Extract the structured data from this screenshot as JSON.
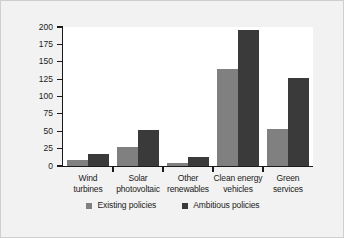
{
  "chart_data": {
    "type": "bar",
    "title": "",
    "subtitle": "",
    "xlabel": "",
    "ylabel": "US$ 2009 (billions)",
    "categories": [
      "Wind\nturbines",
      "Solar\nphotovoltaic",
      "Other\nrenewables",
      "Clean energy\nvehicles",
      "Green\nservices"
    ],
    "category_lines": [
      [
        "Wind",
        "turbines"
      ],
      [
        "Solar",
        "photovoltaic"
      ],
      [
        "Other",
        "renewables"
      ],
      [
        "Clean energy",
        "vehicles"
      ],
      [
        "Green",
        "services"
      ]
    ],
    "series": [
      {
        "name": "Existing policies",
        "color": "#808080",
        "values": [
          9,
          28,
          4,
          139,
          53
        ]
      },
      {
        "name": "Ambitious policies",
        "color": "#3a3a3a",
        "values": [
          17,
          52,
          13,
          195,
          127
        ]
      }
    ],
    "ylim": [
      0,
      200
    ],
    "ytick_values": [
      0,
      25,
      50,
      75,
      100,
      125,
      150,
      175,
      200
    ],
    "ytick_labels": [
      "0",
      "25",
      "50",
      "75",
      "100",
      "125",
      "150",
      "175",
      "200"
    ],
    "grid": false,
    "legend_position": "bottom-center",
    "axis_color": "#1b1b1b",
    "plot_background": "#ffffff",
    "figure_background": "#f2f2f2"
  },
  "legend": {
    "entries": [
      {
        "label": "Existing policies",
        "color": "#808080"
      },
      {
        "label": "Ambitious policies",
        "color": "#3a3a3a"
      }
    ]
  }
}
